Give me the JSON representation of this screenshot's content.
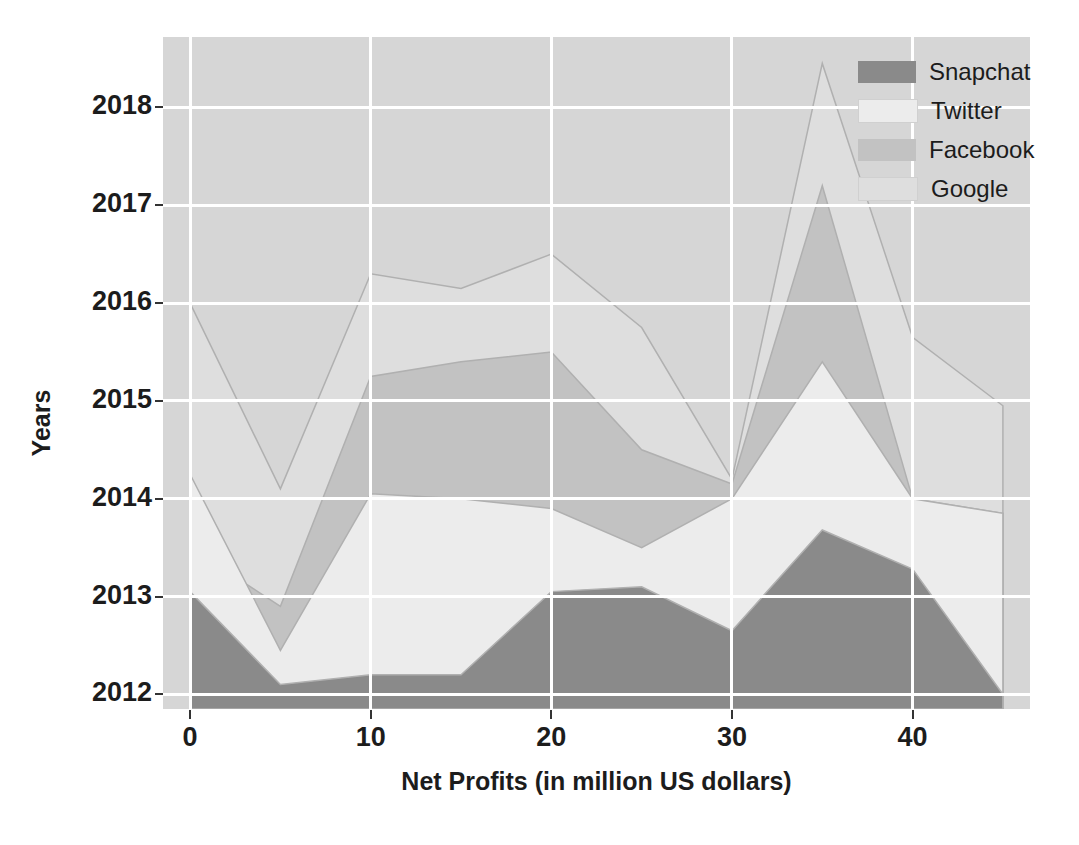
{
  "chart_data": {
    "type": "area",
    "title": "",
    "xlabel": "Net Profits (in million US dollars)",
    "ylabel": "Years",
    "xlim": [
      -1.5,
      46.5
    ],
    "ylim": [
      2011.85,
      2018.72
    ],
    "xticks": [
      0,
      10,
      20,
      30,
      40
    ],
    "yticks": [
      2012,
      2013,
      2014,
      2015,
      2016,
      2017,
      2018
    ],
    "grid": true,
    "legend_position": "upper right",
    "x": [
      0,
      5,
      10,
      15,
      20,
      25,
      30,
      35,
      40,
      45
    ],
    "series": [
      {
        "name": "Snapchat",
        "color": "#8a8a8a",
        "values": [
          2013.05,
          2012.1,
          2012.2,
          2012.2,
          2013.05,
          2013.1,
          2012.65,
          2013.68,
          2013.28,
          2012.0
        ]
      },
      {
        "name": "Twitter",
        "color": "#ececec",
        "values": [
          2014.25,
          2012.45,
          2014.05,
          2014.0,
          2013.9,
          2013.5,
          2014.0,
          2015.4,
          2014.0,
          2013.85
        ]
      },
      {
        "name": "Facebook",
        "color": "#c2c2c2",
        "values": [
          2013.5,
          2012.9,
          2015.25,
          2015.4,
          2015.5,
          2014.5,
          2014.15,
          2017.2,
          2014.0,
          2013.85
        ]
      },
      {
        "name": "Google",
        "color": "#dedede",
        "values": [
          2016.0,
          2014.1,
          2016.3,
          2016.15,
          2016.5,
          2015.75,
          2014.2,
          2018.45,
          2015.65,
          2014.95
        ]
      }
    ]
  },
  "axes": {
    "ylabel": "Years",
    "xlabel": "Net Profits (in million US dollars)",
    "yticklabels": [
      "2018",
      "2017",
      "2016",
      "2015",
      "2014",
      "2013",
      "2012"
    ],
    "xticklabels": [
      "0",
      "10",
      "20",
      "30",
      "40"
    ]
  },
  "legend": {
    "items": [
      {
        "label": "Snapchat",
        "color": "#8a8a8a"
      },
      {
        "label": "Twitter",
        "color": "#ececec"
      },
      {
        "label": "Facebook",
        "color": "#c2c2c2"
      },
      {
        "label": "Google",
        "color": "#dedede"
      }
    ]
  },
  "caption": {
    "text": ""
  },
  "style": {
    "plot_background": "#d6d6d6",
    "grid_color": "#ffffff",
    "figure_background": "#ffffff",
    "text_color": "#1c1c1c"
  }
}
